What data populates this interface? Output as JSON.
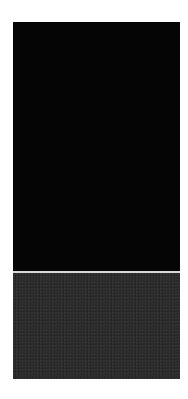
{
  "figure": {
    "type": "astronomical deep-field image with zoomed inset",
    "top_panel": {
      "description": "Wide field of galaxies and stars on black sky",
      "inset_box": {
        "x": 30,
        "y": 209,
        "w": 45,
        "h": 30
      },
      "marker_circle": {
        "x": 50,
        "y": 222,
        "r": 4
      },
      "objects": [
        {
          "x": 15,
          "y": 8,
          "rx": 3,
          "ry": 3,
          "b": 0.9
        },
        {
          "x": 28,
          "y": 7,
          "rx": 2.5,
          "ry": 2.5,
          "b": 0.85
        },
        {
          "x": 6,
          "y": 13,
          "rx": 2,
          "ry": 2,
          "b": 0.7
        },
        {
          "x": 4,
          "y": 36,
          "rx": 3,
          "ry": 3,
          "b": 0.85
        },
        {
          "x": 46,
          "y": 4,
          "rx": 2,
          "ry": 2,
          "b": 0.7
        },
        {
          "x": 84,
          "y": 2,
          "rx": 2.5,
          "ry": 2.5,
          "b": 0.85
        },
        {
          "x": 106,
          "y": 4,
          "rx": 2,
          "ry": 2,
          "b": 0.8
        },
        {
          "x": 104,
          "y": 18,
          "rx": 5,
          "ry": 5,
          "b": 0.95
        },
        {
          "x": 95,
          "y": 18,
          "rx": 2.5,
          "ry": 2.5,
          "b": 0.8
        },
        {
          "x": 120,
          "y": 7,
          "rx": 1.5,
          "ry": 1.5,
          "b": 0.6
        },
        {
          "x": 62,
          "y": 52,
          "rx": 2,
          "ry": 7,
          "b": 0.9,
          "rot": 0
        },
        {
          "x": 70,
          "y": 73,
          "rx": 7,
          "ry": 6,
          "b": 1.0
        },
        {
          "x": 20,
          "y": 56,
          "rx": 1.5,
          "ry": 4,
          "b": 0.6,
          "rot": 40
        },
        {
          "x": 105,
          "y": 62,
          "rx": 4,
          "ry": 4,
          "b": 0.9
        },
        {
          "x": 97,
          "y": 70,
          "rx": 3,
          "ry": 5,
          "b": 0.9
        },
        {
          "x": 92,
          "y": 74,
          "rx": 2,
          "ry": 2,
          "b": 0.7
        },
        {
          "x": 132,
          "y": 50,
          "rx": 1.5,
          "ry": 3,
          "b": 0.6,
          "rot": 30
        },
        {
          "x": 125,
          "y": 82,
          "rx": 3,
          "ry": 6,
          "b": 0.85,
          "rot": -30
        },
        {
          "x": 49,
          "y": 75,
          "rx": 2.5,
          "ry": 2.5,
          "b": 0.8
        },
        {
          "x": 44,
          "y": 81,
          "rx": 2,
          "ry": 2,
          "b": 0.7
        },
        {
          "x": 5,
          "y": 89,
          "rx": 3,
          "ry": 3,
          "b": 0.85
        },
        {
          "x": 93,
          "y": 89,
          "rx": 1.5,
          "ry": 1.5,
          "b": 0.6
        },
        {
          "x": 99,
          "y": 89,
          "rx": 1.5,
          "ry": 1.5,
          "b": 0.6
        },
        {
          "x": 42,
          "y": 106,
          "rx": 6,
          "ry": 4,
          "b": 0.9,
          "rot": 30
        },
        {
          "x": 124,
          "y": 106,
          "rx": 2.5,
          "ry": 2.5,
          "b": 0.8
        },
        {
          "x": 155,
          "y": 110,
          "rx": 5,
          "ry": 5,
          "b": 0.95
        },
        {
          "x": 144,
          "y": 102,
          "rx": 2,
          "ry": 2,
          "b": 0.7
        },
        {
          "x": 48,
          "y": 138,
          "rx": 3,
          "ry": 3,
          "b": 0.7
        },
        {
          "x": 63,
          "y": 150,
          "rx": 2,
          "ry": 2,
          "b": 0.7
        },
        {
          "x": 18,
          "y": 128,
          "rx": 1.5,
          "ry": 1.5,
          "b": 0.6
        },
        {
          "x": 147,
          "y": 122,
          "rx": 4,
          "ry": 4,
          "b": 0.9
        },
        {
          "x": 161,
          "y": 136,
          "rx": 5,
          "ry": 5,
          "b": 0.95
        },
        {
          "x": 101,
          "y": 142,
          "rx": 2,
          "ry": 2,
          "b": 0.7
        },
        {
          "x": 101,
          "y": 155,
          "rx": 3,
          "ry": 4,
          "b": 0.85
        },
        {
          "x": 126,
          "y": 149,
          "rx": 3.5,
          "ry": 3.5,
          "b": 0.9
        },
        {
          "x": 128,
          "y": 160,
          "rx": 3.5,
          "ry": 3.5,
          "b": 0.9
        },
        {
          "x": 31,
          "y": 164,
          "rx": 2.5,
          "ry": 2.5,
          "b": 0.8
        },
        {
          "x": 60,
          "y": 190,
          "rx": 2,
          "ry": 2,
          "b": 0.7
        },
        {
          "x": 91,
          "y": 183,
          "rx": 1.5,
          "ry": 5,
          "b": 0.7,
          "rot": 60
        },
        {
          "x": 101,
          "y": 180,
          "rx": 1.5,
          "ry": 3,
          "b": 0.6,
          "rot": 60
        },
        {
          "x": 122,
          "y": 182,
          "rx": 4,
          "ry": 4,
          "b": 0.9
        },
        {
          "x": 121,
          "y": 192,
          "rx": 5,
          "ry": 5,
          "b": 0.95
        },
        {
          "x": 148,
          "y": 187,
          "rx": 3.5,
          "ry": 5,
          "b": 0.9
        },
        {
          "x": 26,
          "y": 197,
          "rx": 3,
          "ry": 3,
          "b": 0.85
        },
        {
          "x": 10,
          "y": 185,
          "rx": 2,
          "ry": 2,
          "b": 0.7
        },
        {
          "x": 37,
          "y": 206,
          "rx": 1.5,
          "ry": 2,
          "b": 0.6
        },
        {
          "x": 75,
          "y": 200,
          "rx": 2,
          "ry": 2,
          "b": 0.7
        },
        {
          "x": 151,
          "y": 208,
          "rx": 2.5,
          "ry": 2.5,
          "b": 0.8
        },
        {
          "x": 129,
          "y": 216,
          "rx": 16,
          "ry": 16,
          "b": 1.0
        },
        {
          "x": 152,
          "y": 229,
          "rx": 3.5,
          "ry": 3.5,
          "b": 0.85
        },
        {
          "x": 54,
          "y": 213,
          "rx": 2,
          "ry": 2,
          "b": 0.85
        },
        {
          "x": 68,
          "y": 224,
          "rx": 3,
          "ry": 3,
          "b": 0.95
        },
        {
          "x": 64,
          "y": 235,
          "rx": 2.5,
          "ry": 2.5,
          "b": 0.9
        },
        {
          "x": 97,
          "y": 229,
          "rx": 1.5,
          "ry": 2.5,
          "b": 0.6
        },
        {
          "x": 21,
          "y": 247,
          "rx": 3,
          "ry": 3,
          "b": 0.85
        },
        {
          "x": 1,
          "y": 220,
          "rx": 1.5,
          "ry": 2,
          "b": 0.6
        }
      ]
    },
    "bottom_panel": {
      "description": "Zoomed view of inset region",
      "marker_circle": {
        "x": 77,
        "y": 53,
        "r": 7
      },
      "objects": [
        {
          "x": 89,
          "y": 17,
          "rx": 11,
          "ry": 11,
          "b": 1.0
        },
        {
          "x": 130,
          "y": 32,
          "rx": 4,
          "ry": 4,
          "b": 0.8
        },
        {
          "x": 145,
          "y": 56,
          "rx": 15,
          "ry": 14,
          "b": 1.0
        },
        {
          "x": 129,
          "y": 99,
          "rx": 14,
          "ry": 14,
          "b": 1.0
        },
        {
          "x": 35,
          "y": 56,
          "rx": 3,
          "ry": 3,
          "b": 0.35
        }
      ]
    }
  }
}
